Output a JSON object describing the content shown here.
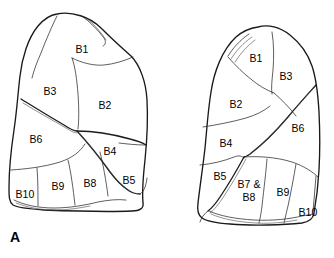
{
  "figure": {
    "panel_letter": "A",
    "colors": {
      "background": "#ffffff",
      "outline": "#1a1a1a",
      "segment_line": "#2a2a2a",
      "label_text": "#000000"
    }
  },
  "left_lung": {
    "name": "left-lateral-lung-view",
    "labels": [
      {
        "id": "l-b1",
        "text": "B1",
        "x": 82,
        "y": 49
      },
      {
        "id": "l-b3",
        "text": "B3",
        "x": 50,
        "y": 91
      },
      {
        "id": "l-b2",
        "text": "B2",
        "x": 105,
        "y": 105
      },
      {
        "id": "l-b6",
        "text": "B6",
        "x": 36,
        "y": 139
      },
      {
        "id": "l-b4",
        "text": "B4",
        "x": 110,
        "y": 151
      },
      {
        "id": "l-b5",
        "text": "B5",
        "x": 129,
        "y": 180
      },
      {
        "id": "l-b8",
        "text": "B8",
        "x": 90,
        "y": 183
      },
      {
        "id": "l-b9",
        "text": "B9",
        "x": 58,
        "y": 186
      },
      {
        "id": "l-b10",
        "text": "B10",
        "x": 25,
        "y": 194
      }
    ]
  },
  "right_lung": {
    "name": "right-lateral-lung-view",
    "labels": [
      {
        "id": "r-b1",
        "text": "B1",
        "x": 256,
        "y": 58
      },
      {
        "id": "r-b3",
        "text": "B3",
        "x": 286,
        "y": 76
      },
      {
        "id": "r-b2",
        "text": "B2",
        "x": 236,
        "y": 104
      },
      {
        "id": "r-b6",
        "text": "B6",
        "x": 298,
        "y": 128
      },
      {
        "id": "r-b4",
        "text": "B4",
        "x": 226,
        "y": 143
      },
      {
        "id": "r-b5",
        "text": "B5",
        "x": 220,
        "y": 176
      },
      {
        "id": "r-b9",
        "text": "B9",
        "x": 283,
        "y": 192
      },
      {
        "id": "r-b10",
        "text": "B10",
        "x": 308,
        "y": 212
      }
    ],
    "labels_two_line": [
      {
        "id": "r-b78",
        "line1": "B7 &",
        "line2": "B8",
        "x": 249,
        "y": 190
      }
    ]
  }
}
